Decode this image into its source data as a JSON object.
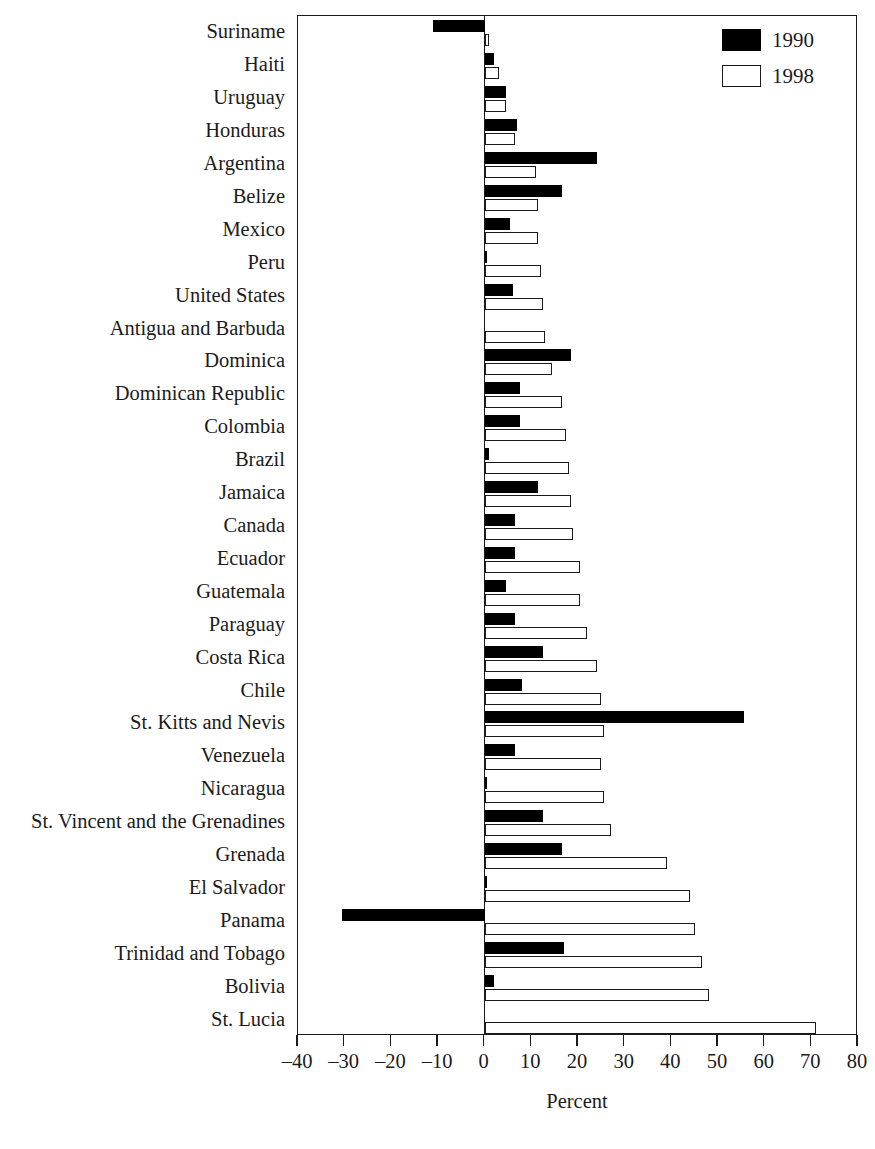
{
  "chart_data": {
    "type": "bar",
    "orientation": "horizontal",
    "title": "",
    "xlabel": "Percent",
    "ylabel": "",
    "xlim": [
      -40,
      80
    ],
    "xticks": [
      -40,
      -30,
      -20,
      -10,
      0,
      10,
      20,
      30,
      40,
      50,
      60,
      70,
      80
    ],
    "xticklabels": [
      "–40",
      "–30",
      "–20",
      "–10",
      "0",
      "10",
      "20",
      "30",
      "40",
      "50",
      "60",
      "70",
      "80"
    ],
    "grid": false,
    "legend_position": "top-right",
    "legend": [
      "1990",
      "1998"
    ],
    "categories": [
      "Suriname",
      "Haiti",
      "Uruguay",
      "Honduras",
      "Argentina",
      "Belize",
      "Mexico",
      "Peru",
      "United States",
      "Antigua and Barbuda",
      "Dominica",
      "Dominican Republic",
      "Colombia",
      "Brazil",
      "Jamaica",
      "Canada",
      "Ecuador",
      "Guatemala",
      "Paraguay",
      "Costa Rica",
      "Chile",
      "St. Kitts and Nevis",
      "Venezuela",
      "Nicaragua",
      "St. Vincent and the Grenadines",
      "Grenada",
      "El Salvador",
      "Panama",
      "Trinidad and Tobago",
      "Bolivia",
      "St. Lucia"
    ],
    "series": [
      {
        "name": "1990",
        "color": "#000000",
        "values": [
          -11,
          2,
          4.5,
          7,
          24,
          16.5,
          5.5,
          0.5,
          6,
          0,
          18.5,
          7.5,
          7.5,
          1,
          11.5,
          6.5,
          6.5,
          4.5,
          6.5,
          12.5,
          8,
          55.5,
          6.5,
          0.5,
          12.5,
          16.5,
          0.5,
          -30.5,
          17,
          2,
          0
        ]
      },
      {
        "name": "1998",
        "color": "#ffffff",
        "values": [
          1,
          3,
          4.5,
          6.5,
          11,
          11.5,
          11.5,
          12,
          12.5,
          13,
          14.5,
          16.5,
          17.5,
          18,
          18.5,
          19,
          20.5,
          20.5,
          22,
          24,
          25,
          25.5,
          25,
          25.5,
          27,
          39,
          44,
          45,
          46.5,
          48,
          71
        ]
      }
    ]
  },
  "legend": {
    "items": [
      {
        "label": "1990",
        "swatch": "filled-black-square"
      },
      {
        "label": "1998",
        "swatch": "open-white-square"
      }
    ]
  },
  "axis": {
    "x_title": "Percent"
  }
}
